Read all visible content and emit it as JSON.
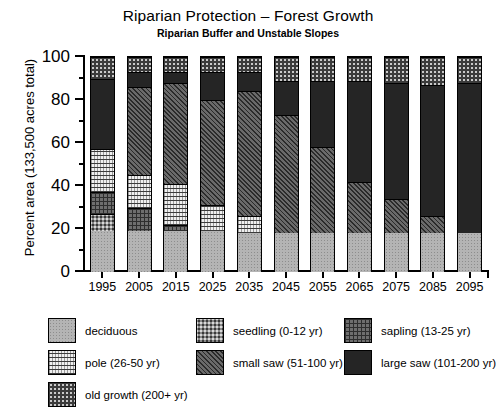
{
  "chart_data": {
    "type": "bar",
    "title": "Riparian Protection – Forest Growth",
    "subtitle": "Riparian Buffer and Unstable Slopes",
    "xlabel": "",
    "ylabel": "Percent area (133,500 acres total)",
    "ylim": [
      0,
      100
    ],
    "yticks": [
      0,
      20,
      40,
      60,
      80,
      100
    ],
    "yticks_minor": [
      10,
      30,
      50,
      70,
      90
    ],
    "grid": false,
    "stacked": true,
    "legend_position": "bottom",
    "categories": [
      "1995",
      "2005",
      "2015",
      "2025",
      "2035",
      "2045",
      "2055",
      "2065",
      "2075",
      "2085",
      "2095"
    ],
    "series": [
      {
        "name": "deciduous",
        "label": "deciduous",
        "values": [
          19,
          19,
          19,
          19,
          18,
          18,
          18,
          18,
          18,
          18,
          18
        ]
      },
      {
        "name": "seedling",
        "label": "seedling (0-12 yr)",
        "values": [
          8,
          0,
          0,
          0,
          0,
          0,
          0,
          0,
          0,
          0,
          0
        ]
      },
      {
        "name": "sapling",
        "label": "sapling (13-25 yr)",
        "values": [
          10,
          11,
          3,
          0,
          0,
          0,
          0,
          0,
          0,
          0,
          0
        ]
      },
      {
        "name": "pole",
        "label": "pole (26-50 yr)",
        "values": [
          20,
          15,
          19,
          12,
          8,
          0,
          0,
          0,
          0,
          0,
          0
        ]
      },
      {
        "name": "small saw",
        "label": "small saw (51-100 yr)",
        "values": [
          0,
          41,
          47,
          49,
          58,
          55,
          40,
          24,
          16,
          8,
          0
        ]
      },
      {
        "name": "large saw",
        "label": "large saw (101-200 yr)",
        "values": [
          33,
          7,
          5,
          13,
          9,
          16,
          31,
          47,
          54,
          61,
          70
        ]
      },
      {
        "name": "old growth",
        "label": "old growth (200+ yr)",
        "values": [
          10,
          7,
          7,
          7,
          7,
          11,
          11,
          11,
          12,
          13,
          12
        ]
      }
    ]
  },
  "legend": {
    "items": [
      {
        "label": "deciduous",
        "swatch": "deciduous-swatch"
      },
      {
        "label": "seedling (0-12 yr)",
        "swatch": "seedling-swatch"
      },
      {
        "label": "sapling (13-25 yr)",
        "swatch": "sapling-swatch"
      },
      {
        "label": "pole (26-50 yr)",
        "swatch": "pole-swatch"
      },
      {
        "label": "small saw (51-100 yr)",
        "swatch": "small-saw-swatch"
      },
      {
        "label": "large saw (101-200 yr)",
        "swatch": "large-saw-swatch"
      },
      {
        "label": "old growth (200+ yr)",
        "swatch": "old-growth-swatch"
      }
    ]
  }
}
